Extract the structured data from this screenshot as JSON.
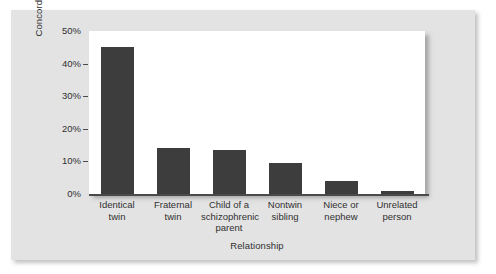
{
  "figure": {
    "panel_background": "#e3e3e3",
    "plot_background": "#ffffff",
    "bar_color": "#3d3d3d",
    "axis_color": "#4a4a4a"
  },
  "chart_data": {
    "type": "bar",
    "title": "",
    "xlabel": "Relationship",
    "ylabel": "Concordance rate",
    "categories": [
      "Identical\ntwin",
      "Fraternal\ntwin",
      "Child of a\nschizophrenic\nparent",
      "Nontwin\nsibling",
      "Niece or\nnephew",
      "Unrelated\nperson"
    ],
    "values": [
      45,
      14,
      13.5,
      9.5,
      4,
      1
    ],
    "ylim": [
      0,
      50
    ],
    "yticks": [
      0,
      10,
      20,
      30,
      40,
      50
    ],
    "ytick_labels": [
      "0%",
      "10%",
      "20%",
      "30%",
      "40%",
      "50%"
    ],
    "grid": false,
    "legend": null,
    "series": [
      {
        "name": "Concordance rate",
        "values": [
          45,
          14,
          13.5,
          9.5,
          4,
          1
        ]
      }
    ]
  }
}
